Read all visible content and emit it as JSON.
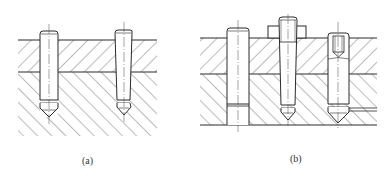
{
  "figure": {
    "stroke_color": "#2a2a2a",
    "hatch_color": "#555555",
    "panels": [
      {
        "id": "a",
        "caption": "(a)",
        "plates": 2,
        "pins": [
          {
            "type": "taper-pin",
            "variant": "blind-hole"
          },
          {
            "type": "taper-pin",
            "variant": "blind-hole"
          }
        ]
      },
      {
        "id": "b",
        "caption": "(b)",
        "plates": 2,
        "pins": [
          {
            "type": "taper-pin",
            "variant": "through-hole"
          },
          {
            "type": "taper-pin",
            "variant": "threaded-end-with-nut"
          },
          {
            "type": "taper-pin",
            "variant": "internal-thread"
          }
        ]
      }
    ]
  }
}
